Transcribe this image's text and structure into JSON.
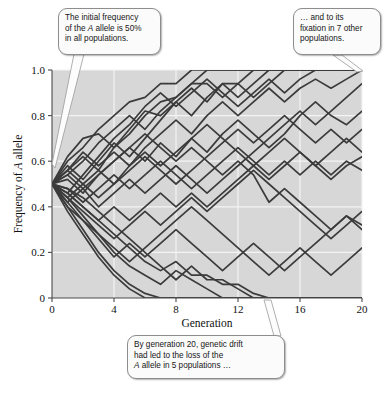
{
  "figure": {
    "callouts": {
      "initial": {
        "line1": "The initial frequency",
        "line2_a": "of the ",
        "line2_i": "A",
        "line2_b": " allele is 50%",
        "line3": "in all populations."
      },
      "fixation": {
        "line1": "… and to its",
        "line2": "fixation in 7 other",
        "line3": "populations."
      },
      "loss": {
        "line1": "By generation 20, genetic drift",
        "line2": "had led to the loss of the",
        "line3_i": "A",
        "line3_b": " allele in 5 populations …"
      }
    },
    "axis": {
      "y_title_a": "Frequency of ",
      "y_title_i": "A",
      "y_title_b": " allele",
      "x_title": "Generation"
    },
    "colors": {
      "plot_background": "#d7d7d7",
      "gridline": "#f2f2f2",
      "line": "#3b3b3b",
      "axis": "#555555",
      "callout_fill": "#fbfbfb",
      "callout_border": "#8d8d8d"
    }
  },
  "chart_data": {
    "type": "line",
    "title": "",
    "xlabel": "Generation",
    "ylabel": "Frequency of A allele",
    "xlim": [
      0,
      20
    ],
    "ylim": [
      0,
      1.0
    ],
    "xticks": [
      0,
      4,
      8,
      12,
      16,
      20
    ],
    "yticks": [
      0,
      0.2,
      0.4,
      0.6,
      0.8,
      1.0
    ],
    "xtick_labels": [
      "0",
      "4",
      "8",
      "12",
      "16",
      "20"
    ],
    "ytick_labels": [
      "0",
      "0.2",
      "0.4",
      "0.6",
      "0.8",
      "1.0"
    ],
    "grid": true,
    "legend": "none",
    "x": [
      0,
      1,
      2,
      3,
      4,
      5,
      6,
      7,
      8,
      9,
      10,
      11,
      12,
      13,
      14,
      15,
      16,
      17,
      18,
      19,
      20
    ],
    "series": [
      {
        "name": "population-1",
        "values": [
          0.5,
          0.6,
          0.66,
          0.74,
          0.8,
          0.86,
          0.88,
          0.94,
          0.94,
          1.0,
          1.0,
          1.0,
          1.0,
          1.0,
          1.0,
          1.0,
          1.0,
          1.0,
          1.0,
          1.0,
          1.0
        ]
      },
      {
        "name": "population-2",
        "values": [
          0.5,
          0.56,
          0.62,
          0.56,
          0.66,
          0.72,
          0.8,
          0.86,
          0.88,
          0.94,
          0.94,
          0.88,
          0.94,
          1.0,
          1.0,
          1.0,
          1.0,
          1.0,
          1.0,
          1.0,
          1.0
        ]
      },
      {
        "name": "population-3",
        "values": [
          0.5,
          0.62,
          0.7,
          0.72,
          0.66,
          0.74,
          0.82,
          0.8,
          0.86,
          0.8,
          0.88,
          0.94,
          0.88,
          0.94,
          1.0,
          1.0,
          1.0,
          1.0,
          1.0,
          1.0,
          1.0
        ]
      },
      {
        "name": "population-4",
        "values": [
          0.5,
          0.54,
          0.6,
          0.68,
          0.74,
          0.8,
          0.74,
          0.82,
          0.88,
          0.94,
          1.0,
          1.0,
          1.0,
          1.0,
          1.0,
          1.0,
          1.0,
          1.0,
          1.0,
          1.0,
          1.0
        ]
      },
      {
        "name": "population-5",
        "values": [
          0.5,
          0.58,
          0.52,
          0.6,
          0.68,
          0.62,
          0.7,
          0.78,
          0.86,
          0.92,
          0.86,
          0.94,
          0.94,
          0.88,
          0.94,
          1.0,
          1.0,
          1.0,
          1.0,
          1.0,
          1.0
        ]
      },
      {
        "name": "population-6",
        "values": [
          0.5,
          0.46,
          0.54,
          0.62,
          0.7,
          0.76,
          0.84,
          0.9,
          0.84,
          0.9,
          0.96,
          0.9,
          0.84,
          0.9,
          0.96,
          0.9,
          0.96,
          1.0,
          1.0,
          1.0,
          1.0
        ]
      },
      {
        "name": "population-7",
        "values": [
          0.5,
          0.56,
          0.64,
          0.58,
          0.64,
          0.58,
          0.66,
          0.72,
          0.78,
          0.72,
          0.8,
          0.86,
          0.8,
          0.86,
          0.92,
          0.86,
          0.92,
          0.96,
          0.92,
          0.96,
          1.0
        ]
      },
      {
        "name": "population-8",
        "values": [
          0.5,
          0.52,
          0.46,
          0.54,
          0.6,
          0.66,
          0.6,
          0.68,
          0.62,
          0.7,
          0.64,
          0.72,
          0.78,
          0.72,
          0.66,
          0.72,
          0.8,
          0.86,
          0.8,
          0.76,
          0.82
        ]
      },
      {
        "name": "population-9",
        "values": [
          0.5,
          0.44,
          0.5,
          0.56,
          0.5,
          0.58,
          0.64,
          0.58,
          0.64,
          0.7,
          0.76,
          0.7,
          0.64,
          0.58,
          0.64,
          0.7,
          0.64,
          0.58,
          0.64,
          0.7,
          0.64
        ]
      },
      {
        "name": "population-10",
        "values": [
          0.5,
          0.48,
          0.42,
          0.48,
          0.54,
          0.48,
          0.54,
          0.6,
          0.54,
          0.48,
          0.54,
          0.6,
          0.66,
          0.6,
          0.54,
          0.6,
          0.54,
          0.6,
          0.54,
          0.6,
          0.56
        ]
      },
      {
        "name": "population-11",
        "values": [
          0.5,
          0.54,
          0.48,
          0.54,
          0.6,
          0.66,
          0.72,
          0.66,
          0.6,
          0.66,
          0.6,
          0.54,
          0.6,
          0.54,
          0.42,
          0.48,
          0.42,
          0.36,
          0.3,
          0.36,
          0.32
        ]
      },
      {
        "name": "population-12",
        "values": [
          0.5,
          0.42,
          0.48,
          0.4,
          0.46,
          0.52,
          0.46,
          0.52,
          0.58,
          0.52,
          0.46,
          0.52,
          0.58,
          0.64,
          0.7,
          0.76,
          0.82,
          0.76,
          0.82,
          0.88,
          0.94
        ]
      },
      {
        "name": "population-13",
        "values": [
          0.5,
          0.46,
          0.4,
          0.34,
          0.4,
          0.34,
          0.4,
          0.46,
          0.4,
          0.46,
          0.4,
          0.46,
          0.52,
          0.58,
          0.52,
          0.58,
          0.64,
          0.58,
          0.52,
          0.58,
          0.62
        ]
      },
      {
        "name": "population-14",
        "values": [
          0.5,
          0.44,
          0.38,
          0.32,
          0.26,
          0.32,
          0.38,
          0.32,
          0.38,
          0.44,
          0.38,
          0.44,
          0.5,
          0.56,
          0.5,
          0.44,
          0.38,
          0.32,
          0.26,
          0.32,
          0.38
        ]
      },
      {
        "name": "population-15",
        "values": [
          0.5,
          0.4,
          0.34,
          0.28,
          0.22,
          0.16,
          0.22,
          0.28,
          0.34,
          0.4,
          0.34,
          0.28,
          0.22,
          0.16,
          0.1,
          0.16,
          0.22,
          0.16,
          0.1,
          0.16,
          0.22
        ]
      },
      {
        "name": "population-16",
        "values": [
          0.5,
          0.42,
          0.34,
          0.26,
          0.18,
          0.24,
          0.18,
          0.24,
          0.3,
          0.24,
          0.18,
          0.12,
          0.18,
          0.24,
          0.18,
          0.12,
          0.18,
          0.24,
          0.3,
          0.36,
          0.3
        ]
      },
      {
        "name": "population-17",
        "values": [
          0.5,
          0.38,
          0.28,
          0.18,
          0.1,
          0.04,
          0.0,
          0.0,
          0.0,
          0.0,
          0.0,
          0.0,
          0.0,
          0.0,
          0.0,
          0.0,
          0.0,
          0.0,
          0.0,
          0.0,
          0.0
        ]
      },
      {
        "name": "population-18",
        "values": [
          0.5,
          0.4,
          0.3,
          0.2,
          0.12,
          0.06,
          0.02,
          0.0,
          0.0,
          0.0,
          0.0,
          0.0,
          0.0,
          0.0,
          0.0,
          0.0,
          0.0,
          0.0,
          0.0,
          0.0,
          0.0
        ]
      },
      {
        "name": "population-19",
        "values": [
          0.5,
          0.44,
          0.36,
          0.28,
          0.2,
          0.14,
          0.1,
          0.06,
          0.12,
          0.08,
          0.04,
          0.0,
          0.0,
          0.0,
          0.0,
          0.0,
          0.0,
          0.0,
          0.0,
          0.0,
          0.0
        ]
      },
      {
        "name": "population-20",
        "values": [
          0.5,
          0.46,
          0.4,
          0.34,
          0.28,
          0.22,
          0.16,
          0.12,
          0.16,
          0.1,
          0.1,
          0.06,
          0.06,
          0.02,
          0.0,
          0.0,
          0.0,
          0.0,
          0.0,
          0.0,
          0.0
        ]
      },
      {
        "name": "population-21",
        "values": [
          0.5,
          0.48,
          0.44,
          0.38,
          0.32,
          0.26,
          0.2,
          0.14,
          0.08,
          0.14,
          0.08,
          0.08,
          0.04,
          0.0,
          0.0,
          0.0,
          0.0,
          0.0,
          0.0,
          0.0,
          0.0
        ]
      },
      {
        "name": "population-22",
        "values": [
          0.5,
          0.56,
          0.5,
          0.44,
          0.5,
          0.56,
          0.62,
          0.56,
          0.5,
          0.56,
          0.62,
          0.68,
          0.74,
          0.68,
          0.74,
          0.8,
          0.74,
          0.68,
          0.74,
          0.68,
          0.74
        ]
      }
    ],
    "annotations": [
      {
        "name": "initial-frequency",
        "text": "The initial frequency of the A allele is 50% in all populations.",
        "points_to": [
          0,
          0.5
        ]
      },
      {
        "name": "fixation",
        "text": "… and to its fixation in 7 other populations.",
        "points_to": [
          20,
          1.0
        ]
      },
      {
        "name": "loss",
        "text": "By generation 20, genetic drift had led to the loss of the A allele in 5 populations …",
        "points_to": [
          14,
          0.0
        ]
      }
    ]
  }
}
